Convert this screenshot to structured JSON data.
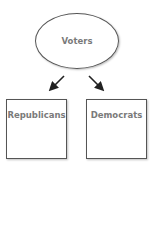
{
  "diagram": {
    "root": {
      "label": "Voters",
      "shape": "ellipse"
    },
    "children": [
      {
        "label": "Republicans",
        "shape": "rectangle"
      },
      {
        "label": "Democrats",
        "shape": "rectangle"
      }
    ],
    "edges": [
      {
        "from": "Voters",
        "to": "Republicans"
      },
      {
        "from": "Voters",
        "to": "Democrats"
      }
    ],
    "colors": {
      "stroke": "#555555",
      "text": "#7a7a7a",
      "arrow": "#222222"
    }
  }
}
